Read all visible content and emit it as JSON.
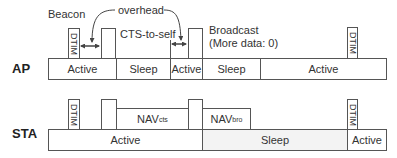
{
  "ap": {
    "label": "AP",
    "segments": [
      {
        "label": "Active",
        "state": "active"
      },
      {
        "label": "Sleep",
        "state": "sleep"
      },
      {
        "label": "Active",
        "state": "active"
      },
      {
        "label": "Sleep",
        "state": "sleep"
      },
      {
        "label": "Active",
        "state": "active"
      }
    ],
    "frames": {
      "dtim_left": "DTIM",
      "dtim_right": "DTIM"
    }
  },
  "sta": {
    "label": "STA",
    "segments": [
      {
        "label": "Active",
        "state": "active"
      },
      {
        "label": "Sleep",
        "state": "sleep"
      },
      {
        "label": "Active",
        "state": "active"
      }
    ],
    "frames": {
      "dtim_left": "DTIM",
      "dtim_right": "DTIM",
      "nav_cts_main": "NAV",
      "nav_cts_sub": "cts",
      "nav_bro_main": "NAV",
      "nav_bro_sub": "bro"
    }
  },
  "annotations": {
    "beacon": "Beacon",
    "overhead": "overhead",
    "cts_to_self": "CTS-to-self",
    "broadcast_line1": "Broadcast",
    "broadcast_line2": "(More data: 0)"
  },
  "colors": {
    "line": "#555555",
    "sleep_fill": "#f3f3f3",
    "text": "#333333"
  }
}
